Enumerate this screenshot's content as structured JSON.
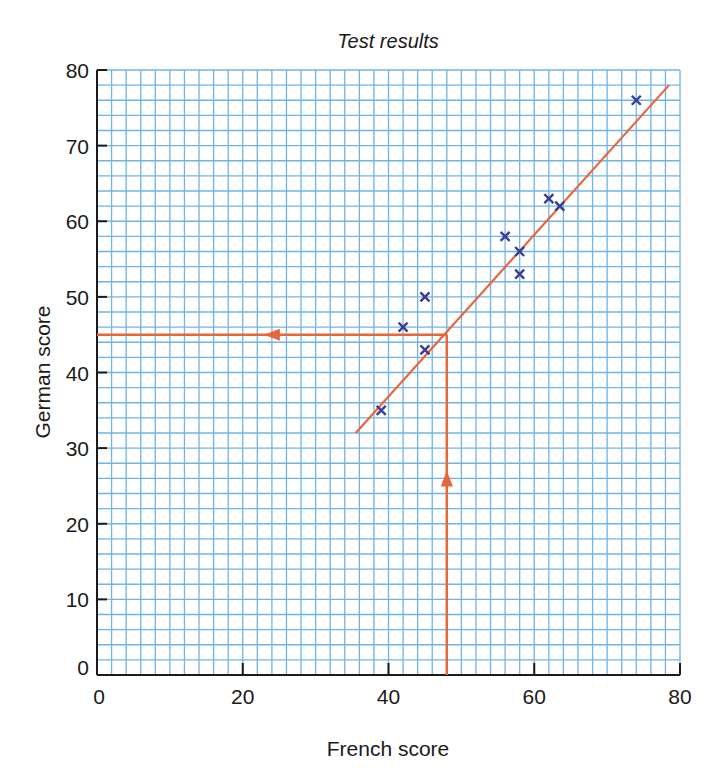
{
  "chart_data": {
    "type": "scatter",
    "title": "Test results",
    "xlabel": "French score",
    "ylabel": "German score",
    "xlim": [
      0,
      80
    ],
    "ylim": [
      0,
      80
    ],
    "xticks": [
      0,
      20,
      40,
      60,
      80
    ],
    "yticks": [
      0,
      10,
      20,
      30,
      40,
      50,
      60,
      70,
      80
    ],
    "grid": true,
    "grid_minor_step": 2,
    "legend": null,
    "series": [
      {
        "name": "Students",
        "marker": "x",
        "color": "#3b3f8f",
        "points": [
          {
            "x": 39,
            "y": 35
          },
          {
            "x": 42,
            "y": 46
          },
          {
            "x": 45,
            "y": 50
          },
          {
            "x": 45,
            "y": 43
          },
          {
            "x": 56,
            "y": 58
          },
          {
            "x": 58,
            "y": 56
          },
          {
            "x": 58,
            "y": 53
          },
          {
            "x": 62,
            "y": 63
          },
          {
            "x": 63.5,
            "y": 62
          },
          {
            "x": 74,
            "y": 76
          }
        ]
      }
    ],
    "best_fit_line": {
      "x1": 35.5,
      "y1": 32,
      "x2": 78.5,
      "y2": 78,
      "color": "#e8663a"
    },
    "annotations": [
      {
        "type": "read-off",
        "from_x": 48,
        "to_y": 45,
        "color": "#e8663a",
        "description": "Vertical arrow up from French score 48 to fit line, horizontal arrow left to German score 45"
      }
    ]
  },
  "colors": {
    "grid": "#6fb4e8",
    "axis": "#1a1a1a",
    "line": "#e8663a",
    "marker": "#3b3f8f"
  }
}
